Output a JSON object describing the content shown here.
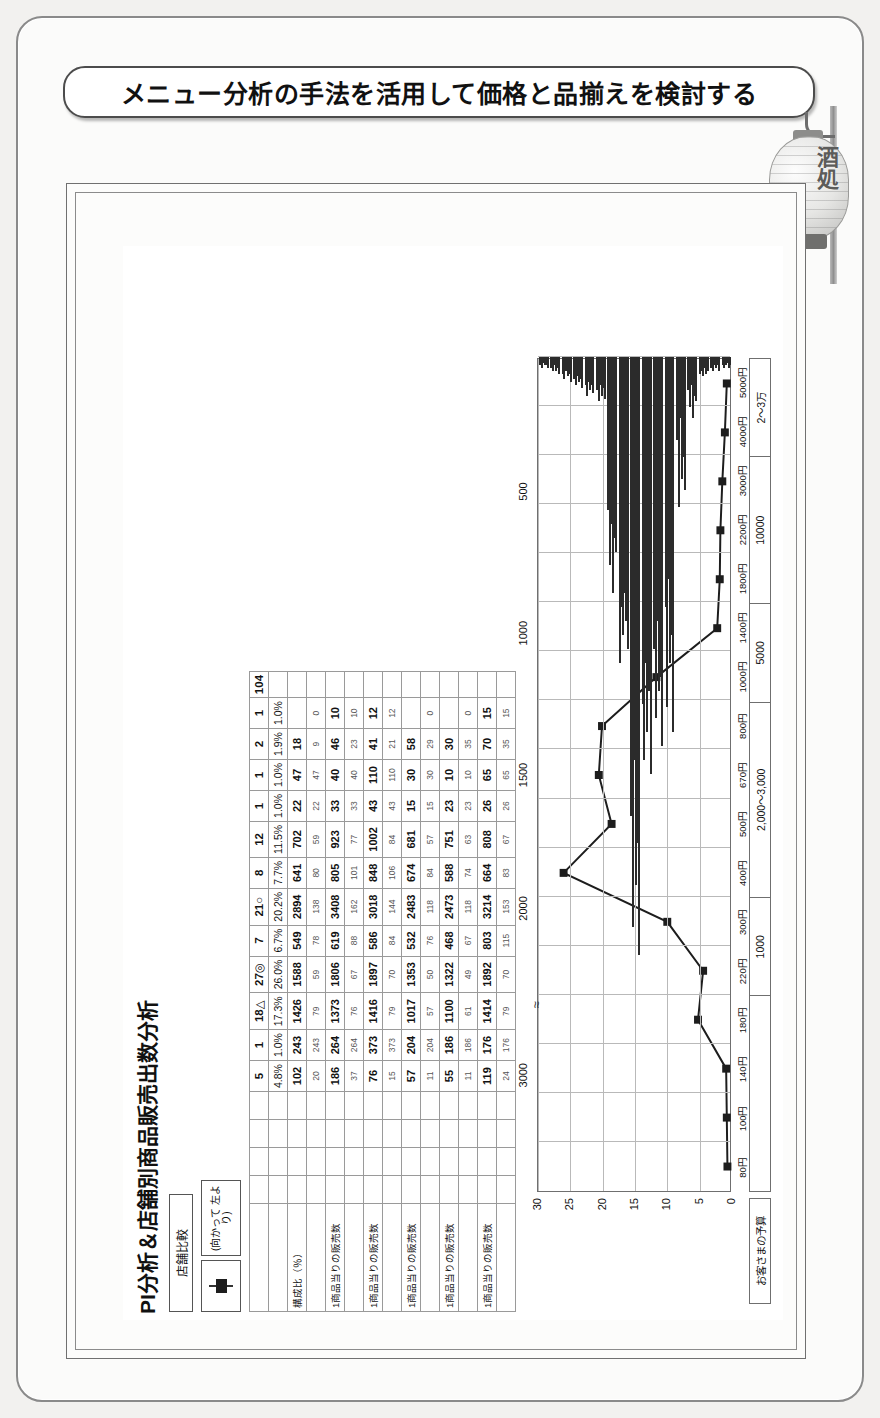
{
  "slide": {
    "title": "メニュー分析の手法を活用して価格と品揃えを検討する",
    "lantern_text": "酒処"
  },
  "sheet": {
    "title": "PI分析＆店舗別商品販売出数分析",
    "legend_box": "店舗比較",
    "legend_note": "(向かって\n左より)",
    "total_label": "104"
  },
  "table": {
    "row_labels": [
      "",
      "構成比（％）",
      "",
      "1商品当りの販売数",
      "",
      "1商品当りの販売数",
      "",
      "1商品当りの販売数",
      "",
      "1商品当りの販売数",
      "",
      "1商品当りの販売数"
    ],
    "headers": [
      "5",
      "1",
      "18△",
      "27◎",
      "7",
      "21○",
      "8",
      "12",
      "1",
      "1",
      "2",
      "1"
    ],
    "rows": [
      {
        "kind": "pct",
        "values": [
          "4.8%",
          "1.0%",
          "17.3%",
          "26.0%",
          "6.7%",
          "20.2%",
          "7.7%",
          "11.5%",
          "1.0%",
          "1.0%",
          "1.9%",
          "1.0%"
        ]
      },
      {
        "kind": "val",
        "values": [
          "102",
          "243",
          "1426",
          "1588",
          "549",
          "2894",
          "641",
          "702",
          "22",
          "47",
          "18",
          ""
        ]
      },
      {
        "kind": "sub",
        "values": [
          "20",
          "243",
          "79",
          "59",
          "78",
          "138",
          "80",
          "59",
          "22",
          "47",
          "9",
          "0"
        ]
      },
      {
        "kind": "val",
        "values": [
          "186",
          "264",
          "1373",
          "1806",
          "619",
          "3408",
          "805",
          "923",
          "33",
          "40",
          "46",
          "10"
        ]
      },
      {
        "kind": "sub",
        "values": [
          "37",
          "264",
          "76",
          "67",
          "88",
          "162",
          "101",
          "77",
          "33",
          "40",
          "23",
          "10"
        ]
      },
      {
        "kind": "val",
        "values": [
          "76",
          "373",
          "1416",
          "1897",
          "586",
          "3018",
          "848",
          "1002",
          "43",
          "110",
          "41",
          "12"
        ]
      },
      {
        "kind": "sub",
        "values": [
          "15",
          "373",
          "79",
          "70",
          "84",
          "144",
          "106",
          "84",
          "43",
          "110",
          "21",
          "12"
        ]
      },
      {
        "kind": "val",
        "values": [
          "57",
          "204",
          "1017",
          "1353",
          "532",
          "2483",
          "674",
          "681",
          "15",
          "30",
          "58",
          ""
        ]
      },
      {
        "kind": "sub",
        "values": [
          "11",
          "204",
          "57",
          "50",
          "76",
          "118",
          "84",
          "57",
          "15",
          "30",
          "29",
          "0"
        ]
      },
      {
        "kind": "val",
        "values": [
          "55",
          "186",
          "1100",
          "1322",
          "468",
          "2473",
          "588",
          "751",
          "23",
          "10",
          "30",
          ""
        ]
      },
      {
        "kind": "sub",
        "values": [
          "11",
          "186",
          "61",
          "49",
          "67",
          "118",
          "74",
          "63",
          "23",
          "10",
          "35",
          "0"
        ]
      },
      {
        "kind": "val",
        "values": [
          "119",
          "176",
          "1414",
          "1892",
          "803",
          "3214",
          "664",
          "808",
          "26",
          "65",
          "70",
          "15"
        ]
      },
      {
        "kind": "sub",
        "values": [
          "24",
          "176",
          "79",
          "70",
          "115",
          "153",
          "83",
          "67",
          "26",
          "65",
          "35",
          "15"
        ]
      }
    ]
  },
  "chart_data": {
    "type": "bar",
    "title": "PI分析＆店舗別商品販売出数分析",
    "xlabel": "お客さまの予算",
    "ylabel": "",
    "orientation": "horizontal-bars-with-line",
    "y_ticks": [
      0,
      5,
      10,
      15,
      20,
      25,
      30
    ],
    "ylim": [
      0,
      30
    ],
    "y2_ticks": [
      500,
      1000,
      1500,
      2000,
      3000
    ],
    "y2_break": true,
    "price_ticks": [
      "80円",
      "100円",
      "140円",
      "180円",
      "220円",
      "300円",
      "400円",
      "500円",
      "670円",
      "800円",
      "1000円",
      "1400円",
      "1800円",
      "2200円",
      "3000円",
      "4000円",
      "5000円"
    ],
    "budget_bands": [
      "",
      "1000",
      "2,000〜3,000",
      "5000",
      "10000",
      "2〜3万"
    ],
    "grid": true,
    "legend": [
      "店舗比較"
    ],
    "line_series": {
      "name": "PI値",
      "points": [
        {
          "price": "80円",
          "value": 0.4
        },
        {
          "price": "100円",
          "value": 0.5
        },
        {
          "price": "140円",
          "value": 0.6
        },
        {
          "price": "180円",
          "value": 5.0
        },
        {
          "price": "220円",
          "value": 4.2
        },
        {
          "price": "300円",
          "value": 9.8
        },
        {
          "price": "400円",
          "value": 26.0
        },
        {
          "price": "500円",
          "value": 18.5
        },
        {
          "price": "670円",
          "value": 20.5
        },
        {
          "price": "800円",
          "value": 20.0
        },
        {
          "price": "1000円",
          "value": 11.5
        },
        {
          "price": "1400円",
          "value": 2.0
        },
        {
          "price": "1800円",
          "value": 1.6
        },
        {
          "price": "2200円",
          "value": 1.5
        },
        {
          "price": "3000円",
          "value": 1.2
        },
        {
          "price": "4000円",
          "value": 0.8
        },
        {
          "price": "5000円",
          "value": 0.5
        }
      ]
    },
    "bar_series": {
      "name": "商品出数",
      "note": "store-by-store thin horizontal bars per price point",
      "values_by_price": {
        "80円": [
          0.3,
          0.4,
          0.3,
          0.2,
          0.4,
          0.3
        ],
        "100円": [
          0.4,
          0.5,
          0.3,
          0.4,
          0.3,
          0.5
        ],
        "140円": [
          0.6,
          0.5,
          0.7,
          0.4,
          0.6,
          0.5
        ],
        "180円": [
          1.2,
          1.8,
          1.0,
          2.2,
          1.4,
          1.6
        ],
        "220円": [
          3.0,
          5.4,
          2.2,
          4.4,
          3.6,
          4.8
        ],
        "300円": [
          9.0,
          12.6,
          8.0,
          11.0,
          10.0,
          13.5
        ],
        "400円": [
          10.5,
          13.0,
          9.5,
          12.0,
          11.5,
          14.0
        ],
        "500円": [
          12.5,
          14.5,
          11.0,
          13.5,
          12.0,
          15.0
        ],
        "670円": [
          16.5,
          20.5,
          14.5,
          19.0,
          17.5,
          21.5
        ],
        "800円": [
          11.0,
          9.0,
          10.0,
          8.5,
          9.5,
          10.5
        ],
        "1000円": [
          5.5,
          7.5,
          6.0,
          8.5,
          6.5,
          7.0
        ],
        "1400円": [
          1.2,
          1.6,
          1.0,
          1.4,
          1.1,
          1.5
        ],
        "1800円": [
          1.0,
          1.4,
          0.9,
          1.2,
          1.0,
          1.3
        ],
        "2200円": [
          0.8,
          1.0,
          0.7,
          0.9,
          0.8,
          1.1
        ],
        "3000円": [
          0.6,
          0.8,
          0.5,
          0.7,
          0.6,
          0.9
        ],
        "4000円": [
          0.4,
          0.5,
          0.3,
          0.5,
          0.4,
          0.6
        ],
        "5000円": [
          0.3,
          0.4,
          0.2,
          0.3,
          0.3,
          0.4
        ]
      }
    }
  }
}
